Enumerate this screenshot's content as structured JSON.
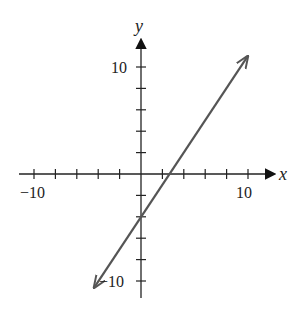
{
  "chart_data": {
    "type": "line",
    "title": "",
    "xlabel": "x",
    "ylabel": "y",
    "xlim": [
      -11,
      12
    ],
    "ylim": [
      -12,
      12
    ],
    "tick_step": 2,
    "x_tick_labels": [
      "-10",
      "10"
    ],
    "y_tick_labels": [
      "10",
      "-10"
    ],
    "grid": false,
    "series": [
      {
        "name": "line",
        "equation": "y = 1.5x - 4",
        "slope": 1.5,
        "y_intercept": -4,
        "x_intercept": 2.67,
        "x": [
          -4.3,
          9.9
        ],
        "y": [
          -10.5,
          10.9
        ],
        "color": "#555555",
        "arrows_both_ends": true
      }
    ]
  },
  "labels": {
    "x_axis": "x",
    "y_axis": "y",
    "x_neg": "−10",
    "x_pos": "10",
    "y_pos": "10",
    "y_neg": "−10"
  }
}
